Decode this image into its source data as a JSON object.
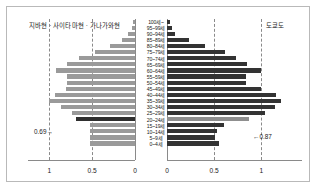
{
  "header": {
    "left_label": "지바현 · 사이타마현 · 가나가와현",
    "right_label": "도쿄도"
  },
  "annotations": {
    "left": "0.69→",
    "right": "←0.87"
  },
  "axis": {
    "left_ticks": [
      "1",
      "0.5",
      "0"
    ],
    "right_ticks": [
      "0",
      "0.5",
      "1"
    ],
    "max": 1.25
  },
  "chart_data": {
    "type": "bar",
    "xlabel": "",
    "ylabel": "",
    "xlim": [
      0,
      1.25
    ],
    "grid": true,
    "legend_position": "top",
    "orientation": "horizontal",
    "layout": "population-pyramid",
    "categories": [
      "100세~",
      "95~99세",
      "90~94세",
      "85~89세",
      "80~84세",
      "75~79세",
      "70~74세",
      "65~69세",
      "60~64세",
      "55~59세",
      "50~54세",
      "45~49세",
      "40~44세",
      "35~39세",
      "30~34세",
      "25~29세",
      "20~24세",
      "15~19세",
      "10~14세",
      "5~9세",
      "0~4세"
    ],
    "series": [
      {
        "name": "지바현 · 사이타마현 · 가나가와현",
        "side": "left",
        "color": "#9a9a9a",
        "values": [
          0.02,
          0.04,
          0.08,
          0.15,
          0.29,
          0.47,
          0.65,
          0.79,
          0.92,
          0.8,
          0.79,
          0.81,
          0.93,
          1.0,
          0.87,
          0.74,
          0.69,
          0.53,
          0.52,
          0.52,
          0.53
        ]
      },
      {
        "name": "도쿄도",
        "side": "right",
        "color": "#333333",
        "values": [
          0.03,
          0.05,
          0.09,
          0.23,
          0.4,
          0.61,
          0.73,
          0.85,
          1.0,
          0.84,
          0.84,
          1.0,
          1.15,
          1.21,
          1.14,
          1.04,
          0.87,
          0.6,
          0.53,
          0.51,
          0.55
        ]
      }
    ],
    "highlighted_category": "20~24세",
    "highlight_values": {
      "left": 0.69,
      "right": 0.87
    }
  }
}
